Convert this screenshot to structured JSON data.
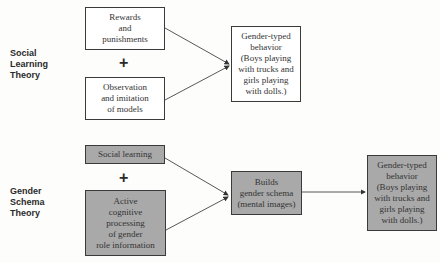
{
  "social_learning_theory": {
    "label": "Social\nLearning\nTheory",
    "label_lines": [
      "Social",
      "Learning",
      "Theory"
    ],
    "input_1": "Rewards and punishments",
    "input_1_lines": [
      "Rewards",
      "and",
      "punishments"
    ],
    "plus": "+",
    "input_2": "Observation and imitation of models",
    "input_2_lines": [
      "Observation",
      "and imitation",
      "of models"
    ],
    "output": "Gender-typed behavior (Boys playing with trucks and girls playing with dolls.)",
    "output_lines": [
      "Gender-typed",
      "behavior",
      "(Boys playing",
      "with trucks and",
      "girls playing",
      "with dolls.)"
    ]
  },
  "gender_schema_theory": {
    "label_lines": [
      "Gender",
      "Schema",
      "Theory"
    ],
    "input_1": "Social learning",
    "plus": "+",
    "input_2_lines": [
      "Active",
      "cognitive",
      "processing",
      "of gender",
      "role information"
    ],
    "middle_lines": [
      "Builds",
      "gender schema",
      "(mental images)"
    ],
    "output_lines": [
      "Gender-typed",
      "behavior",
      "(Boys playing",
      "with trucks and",
      "girls playing",
      "with dolls.)"
    ]
  },
  "colors": {
    "line": "#3a3a3a",
    "gray_box": "#a9a9a9",
    "white_box": "#ffffff"
  }
}
